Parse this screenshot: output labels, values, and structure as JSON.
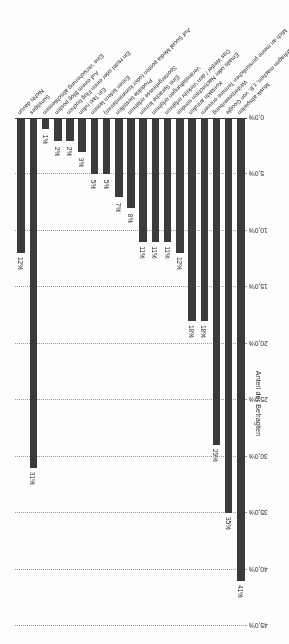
{
  "chart_data": {
    "type": "bar",
    "title": "",
    "xlabel": "",
    "ylabel": "Anteil der Befragten",
    "ylim": [
      0,
      45
    ],
    "ytick_labels": [
      "45,0%",
      "40,0%",
      "35,0%",
      "30,0%",
      "25,0%",
      "20,0%",
      "15,0%",
      "10,0%",
      "5,0%",
      "0,0%"
    ],
    "ytick_values": [
      45,
      40,
      35,
      30,
      25,
      20,
      15,
      10,
      5,
      0
    ],
    "grid": true,
    "legend": "none",
    "orientation": "vertical",
    "bar_color": "#3b3b3b",
    "categories": [
      "Musik abspielen",
      "Suchanfragen machen, z.B. von Google",
      "Weiterbewerbung",
      "Mich an meine persönlichen Termine erinnern",
      "Kontakte anrufen",
      "Emails oder Nachrichten senden",
      "Das Wetter / den Verkehr erfahren",
      "Veranstaltungen erfahren",
      "Eine Sprache lernen",
      "Sportergebnisse erfahren",
      "Produkte bestellen",
      "Auf Social Media posten (oder kommentieren)",
      "Essen liefern lassen",
      "Ein Taxi rufen",
      "Ein Hotel oder einen Flug buchen",
      "Auf einem Blog posten",
      "Eine Versicherung abschliessen",
      "Sonstiges",
      "Nichts davon"
    ],
    "values": [
      41,
      35,
      29,
      18,
      18,
      12,
      11,
      11,
      11,
      8,
      7,
      5,
      5,
      3,
      2,
      2,
      2,
      1,
      31
    ],
    "data_labels": [
      "41%",
      "35%",
      "29%",
      "18%",
      "18%",
      "12%",
      "11%",
      "11%",
      "11%",
      "8%",
      "7%",
      "5%",
      "5%",
      "3%",
      "2%",
      "2%",
      "2%",
      "1%",
      "12%"
    ],
    "bar_display_order": [
      {
        "category": "Musik abspielen",
        "value": 41,
        "label": "41%"
      },
      {
        "category": "Suchanfragen machen, z.B. von Google",
        "value": 35,
        "label": "35%"
      },
      {
        "category": "Weiterbewerbung",
        "value": 29,
        "label": "29%"
      },
      {
        "category": "Mich an meine persönlichen Termine erinnern",
        "value": 18,
        "label": "18%"
      },
      {
        "category": "Kontakte anrufen",
        "value": 18,
        "label": "18%"
      },
      {
        "category": "Emails oder Nachrichten senden",
        "value": 12,
        "label": "12%"
      },
      {
        "category": "Das Wetter / den Verkehr erfahren",
        "value": 11,
        "label": "11%"
      },
      {
        "category": "Veranstaltungen erfahren",
        "value": 11,
        "label": "11%"
      },
      {
        "category": "Eine Sprache lernen",
        "value": 11,
        "label": "11%"
      },
      {
        "category": "Sportergebnisse erfahren",
        "value": 8,
        "label": "8%"
      },
      {
        "category": "Produkte bestellen",
        "value": 7,
        "label": "7%"
      },
      {
        "category": "Auf Social Media posten (oder kommentieren)",
        "value": 5,
        "label": "5%"
      },
      {
        "category": "Essen liefern lassen",
        "value": 5,
        "label": "5%"
      },
      {
        "category": "Ein Taxi rufen",
        "value": 3,
        "label": "3%"
      },
      {
        "category": "Ein Hotel oder einen Flug buchen",
        "value": 2,
        "label": "2%"
      },
      {
        "category": "Auf einem Blog posten",
        "value": 2,
        "label": "2%"
      },
      {
        "category": "Eine Versicherung abschliessen",
        "value": 1,
        "label": "1%"
      },
      {
        "category": "Sonstiges",
        "value": 31,
        "label": "31%"
      },
      {
        "category": "Nichts davon",
        "value": 12,
        "label": "12%"
      }
    ]
  }
}
